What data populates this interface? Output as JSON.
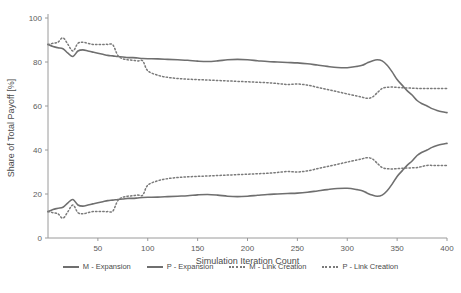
{
  "chart_data": {
    "type": "line",
    "title": "",
    "xlabel": "Simulation Iteration Count",
    "ylabel": "Share of Total Payoff [%]",
    "xlim": [
      0,
      400
    ],
    "ylim": [
      0,
      100
    ],
    "xticks": [
      50,
      100,
      150,
      200,
      250,
      300,
      350,
      400
    ],
    "yticks": [
      0,
      20,
      40,
      60,
      80,
      100
    ],
    "grid": false,
    "legend_position": "bottom",
    "x": [
      0,
      5,
      10,
      15,
      20,
      25,
      30,
      35,
      40,
      45,
      50,
      55,
      60,
      65,
      70,
      75,
      80,
      85,
      90,
      95,
      100,
      110,
      120,
      130,
      140,
      150,
      160,
      170,
      180,
      190,
      200,
      210,
      220,
      230,
      240,
      250,
      260,
      270,
      280,
      290,
      300,
      310,
      315,
      320,
      325,
      330,
      335,
      340,
      345,
      350,
      355,
      360,
      365,
      370,
      375,
      380,
      385,
      390,
      395,
      400
    ],
    "series": [
      {
        "name": "M - Expansion",
        "style": "solid",
        "color": "#6f6f6f",
        "values": [
          88,
          87,
          86.5,
          86,
          84,
          82.5,
          85,
          85.5,
          85,
          84.5,
          84,
          83.5,
          83,
          82.8,
          82.5,
          82.3,
          82,
          82,
          81.8,
          81.6,
          81.5,
          81.4,
          81.2,
          81,
          80.8,
          80.4,
          80.2,
          80.5,
          81,
          81.2,
          81,
          80.6,
          80.2,
          80,
          79.8,
          79.6,
          79.2,
          78.6,
          78,
          77.5,
          77.4,
          78,
          78.5,
          79.6,
          80.5,
          81,
          80.5,
          78.5,
          75.5,
          72,
          69.5,
          67,
          65,
          62.5,
          61,
          60,
          58.8,
          58,
          57.4,
          57
        ]
      },
      {
        "name": "P - Expansion",
        "style": "solid",
        "color": "#6f6f6f",
        "values": [
          12,
          13,
          13.5,
          14,
          16,
          17.5,
          15,
          14.5,
          15,
          15.5,
          16,
          16.5,
          17,
          17.2,
          17.5,
          17.7,
          18,
          18,
          18.2,
          18.4,
          18.5,
          18.6,
          18.8,
          19,
          19.2,
          19.6,
          19.8,
          19.5,
          19,
          18.8,
          19,
          19.4,
          19.8,
          20,
          20.2,
          20.4,
          20.8,
          21.4,
          22,
          22.5,
          22.6,
          22,
          21.5,
          20.4,
          19.5,
          19,
          19.5,
          21.5,
          24.5,
          28,
          30.5,
          33,
          35,
          37.5,
          39,
          40,
          41.2,
          42,
          42.6,
          43
        ]
      },
      {
        "name": "M - Link Creation",
        "style": "dotted",
        "color": "#7a7a7a",
        "values": [
          88,
          88.5,
          89,
          91,
          88,
          85,
          88.5,
          89,
          88.5,
          88,
          88,
          88,
          88,
          87.8,
          83,
          81.5,
          81,
          80.8,
          80.5,
          80.5,
          76,
          74,
          73,
          72.5,
          72.2,
          72,
          71.8,
          71.6,
          71.4,
          71.2,
          71,
          70.8,
          70.6,
          70.2,
          69.8,
          70,
          69.5,
          68.5,
          67.5,
          66.5,
          65.5,
          64.5,
          64,
          63.5,
          64,
          66,
          68,
          68.5,
          68.6,
          68.5,
          68.3,
          68.2,
          68.1,
          68,
          68,
          68,
          68,
          68,
          68,
          68
        ]
      },
      {
        "name": "P - Link Creation",
        "style": "dotted",
        "color": "#7a7a7a",
        "values": [
          12,
          11.5,
          11,
          9,
          12,
          15,
          11.5,
          11,
          11.5,
          12,
          12,
          12,
          12,
          12.2,
          17,
          18.5,
          19,
          19.2,
          19.5,
          19.5,
          24,
          26,
          27,
          27.5,
          27.8,
          28,
          28.2,
          28.4,
          28.6,
          28.8,
          29,
          29.2,
          29.4,
          29.8,
          30.2,
          30,
          30.5,
          31.5,
          32.5,
          33.5,
          34.5,
          35.5,
          36,
          36.5,
          36,
          34,
          32,
          31.5,
          31.4,
          31.5,
          31.7,
          31.8,
          31.9,
          32,
          32.5,
          33,
          33,
          33,
          33,
          33
        ]
      }
    ]
  },
  "legend": {
    "items": [
      {
        "label": "M - Expansion",
        "style": "solid"
      },
      {
        "label": "P - Expansion",
        "style": "solid"
      },
      {
        "label": "M - Link Creation",
        "style": "dotted"
      },
      {
        "label": "P - Link Creation",
        "style": "dotted"
      }
    ]
  }
}
